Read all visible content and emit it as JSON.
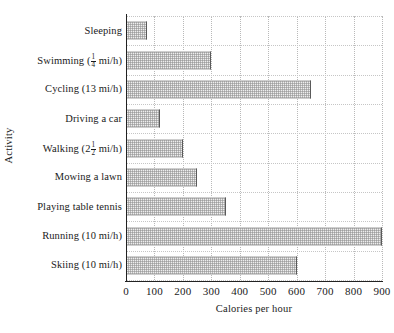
{
  "chart_data": {
    "type": "bar",
    "orientation": "horizontal",
    "title": "",
    "xlabel": "Calories per hour",
    "ylabel": "Activity",
    "xlim": [
      0,
      900
    ],
    "xticks": [
      0,
      100,
      200,
      300,
      400,
      500,
      600,
      700,
      800,
      900
    ],
    "xtick_labels": [
      "0",
      "100",
      "200",
      "300",
      "400",
      "500",
      "600",
      "700",
      "800",
      "900"
    ],
    "grid": true,
    "legend": false,
    "categories": [
      "Sleeping",
      "Swimming (1/4 mi/h)",
      "Cycling (13 mi/h)",
      "Driving a car",
      "Walking (2 1/2 mi/h)",
      "Mowing a lawn",
      "Playing table tennis",
      "Running (10 mi/h)",
      "Skiing (10 mi/h)"
    ],
    "values": [
      75,
      300,
      650,
      120,
      200,
      250,
      350,
      900,
      600
    ],
    "bar_color": "#eeeeee",
    "bar_edge_color": "#5a5a5a",
    "grid_color": "#b9b9b9",
    "axis_color": "#222222"
  },
  "labels": {
    "items": [
      {
        "prefix": "Sleeping",
        "frac_num": "",
        "frac_den": "",
        "suffix": ""
      },
      {
        "prefix": "Swimming (",
        "frac_num": "1",
        "frac_den": "4",
        "suffix": " mi/h)"
      },
      {
        "prefix": "Cycling (13 mi/h)",
        "frac_num": "",
        "frac_den": "",
        "suffix": ""
      },
      {
        "prefix": "Driving a car",
        "frac_num": "",
        "frac_den": "",
        "suffix": ""
      },
      {
        "prefix": "Walking (2",
        "frac_num": "1",
        "frac_den": "2",
        "suffix": " mi/h)"
      },
      {
        "prefix": "Mowing a lawn",
        "frac_num": "",
        "frac_den": "",
        "suffix": ""
      },
      {
        "prefix": "Playing table tennis",
        "frac_num": "",
        "frac_den": "",
        "suffix": ""
      },
      {
        "prefix": "Running (10 mi/h)",
        "frac_num": "",
        "frac_den": "",
        "suffix": ""
      },
      {
        "prefix": "Skiing (10 mi/h)",
        "frac_num": "",
        "frac_den": "",
        "suffix": ""
      }
    ]
  }
}
